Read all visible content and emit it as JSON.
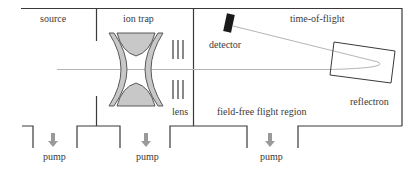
{
  "diagram": {
    "regions": {
      "source": "source",
      "ion_trap": "ion trap",
      "time_of_flight": "time-of-flight"
    },
    "components": {
      "detector": "detector",
      "lens": "lens",
      "reflectron": "reflectron",
      "field_free": "field-free flight region"
    },
    "pumps": [
      {
        "label": "pump"
      },
      {
        "label": "pump"
      },
      {
        "label": "pump"
      }
    ],
    "colors": {
      "wall": "#3a3a3a",
      "electrode_fill": "#c8c8c8",
      "electrode_stroke": "#4a4a4a",
      "beam": "#b0b0b0",
      "pump_arrow": "#9a9a9a",
      "detector": "#1a1a1a"
    }
  }
}
